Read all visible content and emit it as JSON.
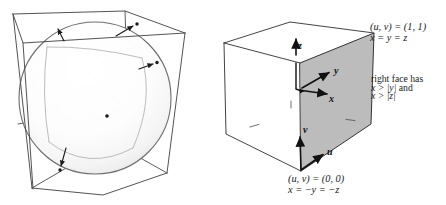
{
  "right_figure": {
    "corner_top_label_1": "(u, v) = (1, 1)",
    "corner_top_label_2": "x = y = z",
    "note_line_1": "right face has",
    "note_line_2_math": "x > |y|",
    "note_line_2_tail": " and",
    "note_line_3": "x > |z|",
    "corner_bottom_label_1": "(u, v) = (0, 0)",
    "corner_bottom_label_2": "x = −y = −z",
    "axis_x": "x",
    "axis_y": "y",
    "axis_z": "z",
    "param_u": "u",
    "param_v": "v"
  },
  "colors": {
    "line": "#3a3a3a",
    "text": "#1b1b1b",
    "face_fill": "#bcbcbc",
    "sphere_outline": "#6e6e6e"
  }
}
